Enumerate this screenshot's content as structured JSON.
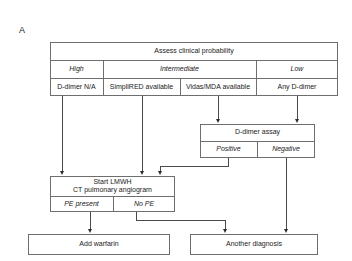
{
  "figure": {
    "panel_label": "A",
    "type": "clinical-decision-flowchart"
  },
  "colors": {
    "box_border": "#6e6e6e",
    "connector": "#4a4a4a",
    "arrow": "#2b2b2b",
    "background": "#ffffff",
    "text": "#1a1a1a"
  },
  "assessment_table": {
    "header": "Assess clinical probability",
    "probability_row": {
      "high": "High",
      "intermediate": "Intermediate",
      "low": "Low"
    },
    "test_row": {
      "high_test": "D-dimer N/A",
      "intermediate_test_1": "SimpliRED available",
      "intermediate_test_2": "Vidas/MDA available",
      "low_test": "Any D-dimer"
    }
  },
  "ddimer_assay": {
    "header": "D-dimer assay",
    "positive": "Positive",
    "negative": "Negative"
  },
  "treatment": {
    "header_line_1": "Start LMWH",
    "header_line_2": "CT pulmonary angiogram",
    "pe_present": "PE present",
    "no_pe": "No PE"
  },
  "outcomes": {
    "warfarin": "Add warfarin",
    "another_diagnosis": "Another diagnosis"
  }
}
